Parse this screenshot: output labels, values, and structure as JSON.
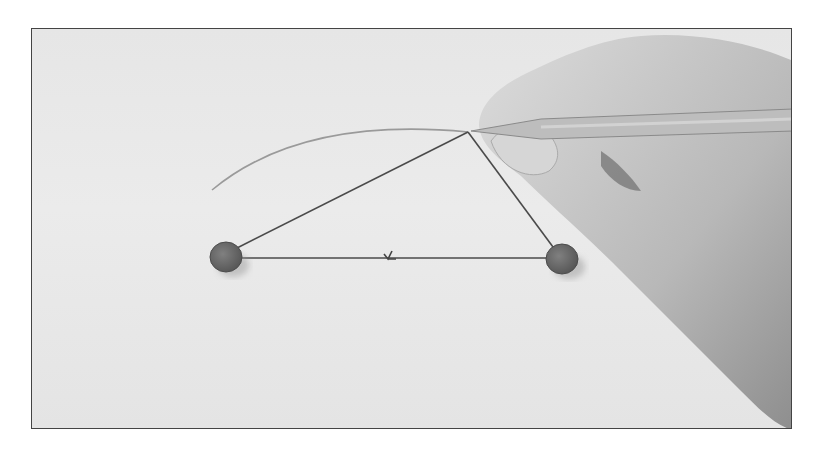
{
  "figure": {
    "frame": {
      "x": 31,
      "y": 28,
      "width": 761,
      "height": 401,
      "border_color": "#444444"
    },
    "colors": {
      "paper": "#e8e8e8",
      "pin": "#6a6a6a",
      "string": "#4a4a4a",
      "arc": "#9a9a9a",
      "skin": "#c9c9c9",
      "pencil": "#bdbdbd"
    },
    "pins": [
      {
        "name": "left-pin",
        "cx": 225,
        "cy": 256,
        "rx": 16,
        "ry": 15
      },
      {
        "name": "right-pin",
        "cx": 561,
        "cy": 258,
        "rx": 16,
        "ry": 15
      }
    ],
    "pencil_tip": {
      "x": 467,
      "y": 131
    },
    "arc": {
      "start": {
        "x": 211,
        "y": 189
      },
      "end": {
        "x": 467,
        "y": 131
      }
    },
    "knot": {
      "x": 389,
      "y": 256
    }
  }
}
